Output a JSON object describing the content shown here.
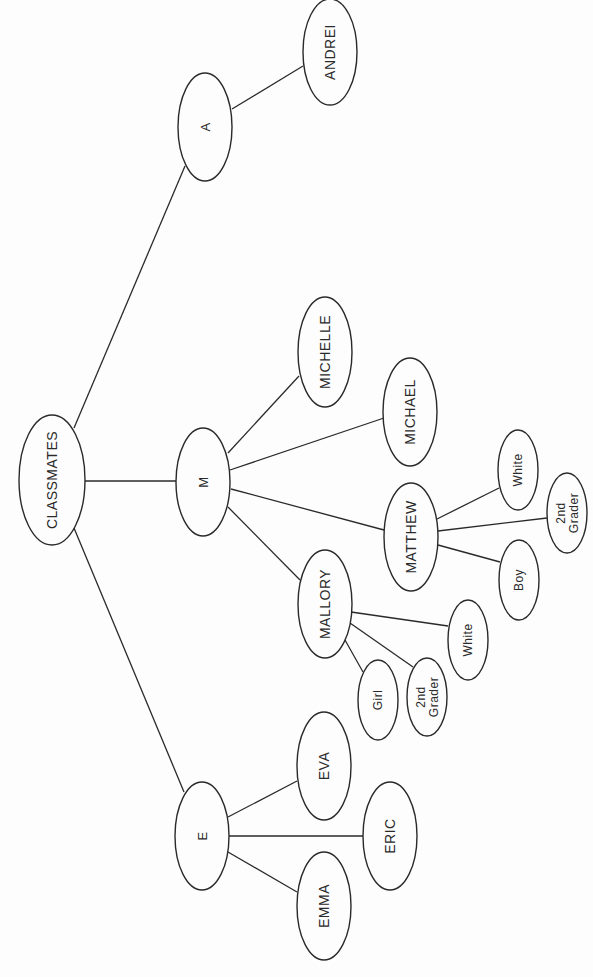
{
  "diagram": {
    "type": "tree",
    "orientation": "rotated-90-ccw",
    "root": "CLASSMATES",
    "colors": {
      "stroke": "#2a2a2a",
      "background": "#fdfdfd"
    },
    "nodes": [
      {
        "id": "classmates",
        "label": [
          "CLASSMATES"
        ],
        "cx": 52,
        "cy": 480,
        "rx": 33,
        "ry": 65,
        "fs": 14
      },
      {
        "id": "a",
        "label": [
          "A"
        ],
        "cx": 205,
        "cy": 127,
        "rx": 27,
        "ry": 54,
        "fs": 13
      },
      {
        "id": "andrei",
        "label": [
          "ANDREI"
        ],
        "cx": 330,
        "cy": 52,
        "rx": 27,
        "ry": 53,
        "fs": 14
      },
      {
        "id": "m",
        "label": [
          "M"
        ],
        "cx": 203,
        "cy": 482,
        "rx": 27,
        "ry": 54,
        "fs": 13
      },
      {
        "id": "michelle",
        "label": [
          "MICHELLE"
        ],
        "cx": 325,
        "cy": 352,
        "rx": 27,
        "ry": 55,
        "fs": 14
      },
      {
        "id": "michael",
        "label": [
          "MICHAEL"
        ],
        "cx": 410,
        "cy": 412,
        "rx": 27,
        "ry": 54,
        "fs": 14
      },
      {
        "id": "matthew",
        "label": [
          "MATTHEW"
        ],
        "cx": 411,
        "cy": 537,
        "rx": 27,
        "ry": 54,
        "fs": 14
      },
      {
        "id": "matthew-white",
        "label": [
          "White"
        ],
        "cx": 518,
        "cy": 470,
        "rx": 20,
        "ry": 40,
        "fs": 12
      },
      {
        "id": "matthew-2nd-grader",
        "label": [
          "2nd",
          "Grader"
        ],
        "cx": 567,
        "cy": 513,
        "rx": 20,
        "ry": 40,
        "fs": 12
      },
      {
        "id": "matthew-boy",
        "label": [
          "Boy"
        ],
        "cx": 519,
        "cy": 580,
        "rx": 20,
        "ry": 40,
        "fs": 12
      },
      {
        "id": "mallory",
        "label": [
          "MALLORY"
        ],
        "cx": 325,
        "cy": 604,
        "rx": 27,
        "ry": 54,
        "fs": 14
      },
      {
        "id": "mallory-white",
        "label": [
          "White"
        ],
        "cx": 468,
        "cy": 640,
        "rx": 20,
        "ry": 40,
        "fs": 12
      },
      {
        "id": "mallory-girl",
        "label": [
          "Girl"
        ],
        "cx": 378,
        "cy": 700,
        "rx": 20,
        "ry": 40,
        "fs": 12
      },
      {
        "id": "mallory-2nd-grader",
        "label": [
          "2nd",
          "Grader"
        ],
        "cx": 427,
        "cy": 697,
        "rx": 20,
        "ry": 39,
        "fs": 12
      },
      {
        "id": "e",
        "label": [
          "E"
        ],
        "cx": 202,
        "cy": 836,
        "rx": 27,
        "ry": 54,
        "fs": 13
      },
      {
        "id": "eva",
        "label": [
          "EVA"
        ],
        "cx": 324,
        "cy": 766,
        "rx": 27,
        "ry": 54,
        "fs": 14
      },
      {
        "id": "eric",
        "label": [
          "ERIC"
        ],
        "cx": 390,
        "cy": 836,
        "rx": 27,
        "ry": 54,
        "fs": 14
      },
      {
        "id": "emma",
        "label": [
          "EMMA"
        ],
        "cx": 324,
        "cy": 906,
        "rx": 27,
        "ry": 54,
        "fs": 14
      }
    ],
    "edges": [
      {
        "from": "classmates",
        "to": "a",
        "x1": 74,
        "y1": 428,
        "x2": 185,
        "y2": 166
      },
      {
        "from": "classmates",
        "to": "m",
        "x1": 85,
        "y1": 481,
        "x2": 176,
        "y2": 481
      },
      {
        "from": "classmates",
        "to": "e",
        "x1": 74,
        "y1": 528,
        "x2": 184,
        "y2": 792
      },
      {
        "from": "a",
        "to": "andrei",
        "x1": 232,
        "y1": 109,
        "x2": 303,
        "y2": 66
      },
      {
        "from": "m",
        "to": "michelle",
        "x1": 228,
        "y1": 453,
        "x2": 299,
        "y2": 376
      },
      {
        "from": "m",
        "to": "michael",
        "x1": 230,
        "y1": 470,
        "x2": 384,
        "y2": 418
      },
      {
        "from": "m",
        "to": "matthew",
        "x1": 231,
        "y1": 489,
        "x2": 384,
        "y2": 530
      },
      {
        "from": "m",
        "to": "mallory",
        "x1": 228,
        "y1": 507,
        "x2": 300,
        "y2": 580
      },
      {
        "from": "matthew",
        "to": "matthew-white",
        "x1": 437,
        "y1": 519,
        "x2": 499,
        "y2": 488
      },
      {
        "from": "matthew",
        "to": "matthew-2nd-grader",
        "x1": 438,
        "y1": 531,
        "x2": 547,
        "y2": 518
      },
      {
        "from": "matthew",
        "to": "matthew-boy",
        "x1": 438,
        "y1": 545,
        "x2": 500,
        "y2": 562
      },
      {
        "from": "mallory",
        "to": "mallory-white",
        "x1": 351,
        "y1": 612,
        "x2": 448,
        "y2": 626
      },
      {
        "from": "mallory",
        "to": "mallory-2nd-grader",
        "x1": 350,
        "y1": 623,
        "x2": 413,
        "y2": 667
      },
      {
        "from": "mallory",
        "to": "mallory-girl",
        "x1": 345,
        "y1": 640,
        "x2": 363,
        "y2": 672
      },
      {
        "from": "e",
        "to": "eva",
        "x1": 228,
        "y1": 817,
        "x2": 297,
        "y2": 781
      },
      {
        "from": "e",
        "to": "eric",
        "x1": 229,
        "y1": 836,
        "x2": 363,
        "y2": 836
      },
      {
        "from": "e",
        "to": "emma",
        "x1": 228,
        "y1": 852,
        "x2": 297,
        "y2": 892
      }
    ]
  }
}
